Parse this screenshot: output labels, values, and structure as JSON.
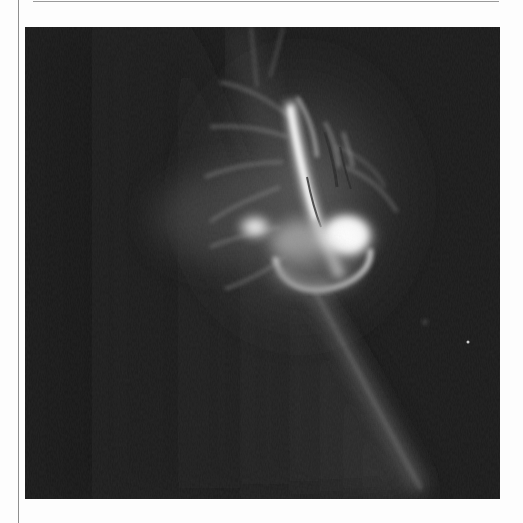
{
  "figure": {
    "palette": {
      "frame_background": "#fdfdfd",
      "rule_color": "#9a9a9a",
      "sky_dark": "#1b1b1b",
      "disk_glow": "#3a3a3a",
      "loop_gray": "#8a8a8a",
      "flare_core": "#ffffff"
    },
    "image_box": {
      "x": 25,
      "y": 27,
      "width": 475,
      "height": 472
    }
  }
}
